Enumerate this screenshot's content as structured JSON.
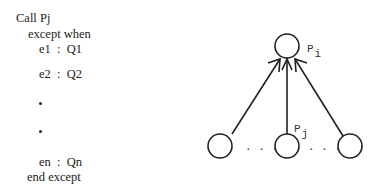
{
  "code": {
    "lines": [
      {
        "text": "Call Pj",
        "x": 16,
        "y": 12
      },
      {
        "text": "except when",
        "x": 28,
        "y": 28
      },
      {
        "text": "e1  :  Q1",
        "x": 39,
        "y": 43
      },
      {
        "text": "e2  :  Q2",
        "x": 39,
        "y": 68
      },
      {
        "text": "en  :  Qn",
        "x": 39,
        "y": 156
      },
      {
        "text": "end except",
        "x": 27,
        "y": 171
      }
    ],
    "ellipsis_dots": [
      {
        "x": 39,
        "y": 102
      },
      {
        "x": 39,
        "y": 130
      }
    ]
  },
  "diagram": {
    "top_node": {
      "label": "P",
      "subscript": "i"
    },
    "middle_node": {
      "label": "P",
      "subscript": "j"
    },
    "bottom_dots_left": ". . .",
    "bottom_dots_right": ". . ."
  }
}
